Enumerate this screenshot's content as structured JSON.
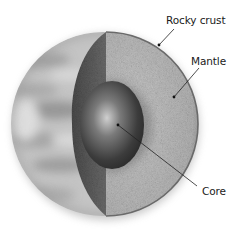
{
  "diagram": {
    "type": "planet-interior-cross-section",
    "labels": {
      "crust": "Rocky crust",
      "mantle": "Mantle",
      "core": "Core"
    },
    "layers": [
      {
        "name": "Rocky crust",
        "color": "#6e6e6e"
      },
      {
        "name": "Mantle",
        "color": "#b8b8b8"
      },
      {
        "name": "Core",
        "color": "#5a5a5a"
      }
    ],
    "colors": {
      "surface": "#c8c8c8",
      "surface_band": "#a9a9a9",
      "mantle_face": "#b8b8b8",
      "crust_edge": "#555555",
      "core_dark": "#3a3a3a",
      "core_light": "#c0c0c0",
      "leader_line": "#222222",
      "background": "#ffffff"
    }
  }
}
